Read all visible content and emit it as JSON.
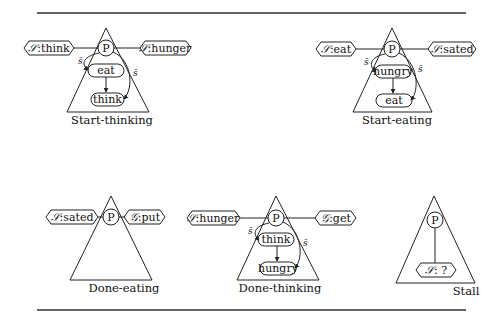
{
  "figure": {
    "panels": [
      {
        "name": "Start-thinking",
        "label": "Start-thinking",
        "process": "P",
        "left_port": {
          "kind": "S",
          "kind_glyph": "𝒮",
          "value": ":think"
        },
        "right_port": {
          "kind": "S",
          "kind_glyph": "𝒮",
          "value": ":hunger"
        },
        "states": [
          "eat",
          "think"
        ],
        "edge_labels": {
          "left": "s̄",
          "right": "s̄"
        }
      },
      {
        "name": "Start-eating",
        "label": "Start-eating",
        "process": "P",
        "left_port": {
          "kind": "S",
          "kind_glyph": "𝒮",
          "value": ":eat"
        },
        "right_port": {
          "kind": "S",
          "kind_glyph": "𝒮",
          "value": ":sated"
        },
        "states": [
          "hungry",
          "eat"
        ],
        "edge_labels": {
          "left": "s̄",
          "right": "s̄"
        }
      },
      {
        "name": "Done-eating",
        "label": "Done-eating",
        "process": "P",
        "left_port": {
          "kind": "S",
          "kind_glyph": "𝒮",
          "value": ":sated"
        },
        "right_port": {
          "kind": "G",
          "kind_glyph": "𝒢",
          "value": ":put"
        },
        "states": []
      },
      {
        "name": "Done-thinking",
        "label": "Done-thinking",
        "process": "P",
        "left_port": {
          "kind": "S",
          "kind_glyph": "𝒮",
          "value": ":hunger"
        },
        "right_port": {
          "kind": "G",
          "kind_glyph": "𝒢",
          "value": ":get"
        },
        "states": [
          "think",
          "hungry"
        ],
        "edge_labels": {
          "left": "s̄",
          "right": "s̄"
        }
      },
      {
        "name": "Stall",
        "label": "Stall",
        "process": "P",
        "bottom_port": {
          "kind": "S",
          "kind_glyph": "𝒮",
          "value": ": ?"
        }
      }
    ]
  }
}
